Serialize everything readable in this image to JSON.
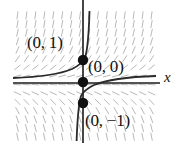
{
  "figure": {
    "kind": "slope-field-with-solution-curves",
    "background_color": "#ffffff",
    "axis_color": "#1a1a1a",
    "curve_color": "#2a2a2a",
    "slope_field_color": "#b9b9b9",
    "point_color": "#111111",
    "axis_label_x": "x",
    "field_box": {
      "x": 13,
      "y": 11,
      "width": 143,
      "height": 130
    },
    "origin": {
      "x": 83,
      "y": 83
    }
  },
  "labels": {
    "point_0_1": "(0, 1)",
    "point_0_0": "(0, 0)",
    "point_0_minus1": "(0, −1)",
    "axis_x": "x"
  },
  "chart_data": {
    "type": "scatter",
    "title": "",
    "xlabel": "x",
    "ylabel": "",
    "grid": false,
    "legend": "none",
    "xlim": [
      -2.4,
      2.4
    ],
    "ylim": [
      -2.2,
      2.2
    ],
    "points": [
      {
        "label": "(0, 1)",
        "x": 0,
        "y": 1
      },
      {
        "label": "(0, 0)",
        "x": 0,
        "y": 0
      },
      {
        "label": "(0, −1)",
        "x": 0,
        "y": -1
      }
    ],
    "curves": [
      {
        "name": "solution-through-(0,1)",
        "through": [
          0,
          1
        ],
        "description": "rises steeply upward for x>0, flattens toward horizontal asymptote for x<0"
      },
      {
        "name": "solution-through-(0,0)",
        "through": [
          0,
          0
        ],
        "description": "equilibrium solution along the x-axis"
      },
      {
        "name": "solution-through-(0,-1)",
        "through": [
          0,
          -1
        ],
        "description": "descends steeply downward for x<0, flattens toward horizontal asymptote for x>0"
      }
    ],
    "slope_field": {
      "description": "short line segments indicating solution slopes on a regular grid",
      "columns": 16,
      "rows": 15
    }
  }
}
